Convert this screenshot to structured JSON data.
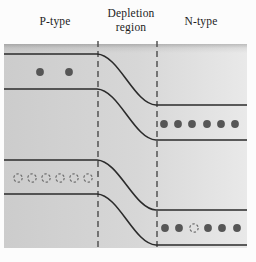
{
  "labels": {
    "p_type": "P-type",
    "depletion_line1": "Depletion",
    "depletion_line2": "region",
    "n_type": "N-type"
  },
  "colors": {
    "page_bg": "#fcfcfc",
    "box_fill_left": "#cccccc",
    "box_fill_right": "#e9e9e9",
    "band_line": "#2b2b2b",
    "boundary_dash": "#4a4a4a",
    "electron_fill": "#565656",
    "hole_stroke": "#6f6f6f",
    "label_text": "#1d1d1d"
  },
  "diagram": {
    "box": {
      "left": 4,
      "top": 44,
      "right": 247,
      "bottom": 248
    },
    "bend": {
      "start_x": 97,
      "end_x": 156
    },
    "bands": [
      {
        "name": "conduction-upper",
        "p_y": 54,
        "n_y": 105
      },
      {
        "name": "conduction-lower",
        "p_y": 89,
        "n_y": 140
      },
      {
        "name": "valence-upper",
        "p_y": 160,
        "n_y": 210
      },
      {
        "name": "valence-lower",
        "p_y": 194,
        "n_y": 245
      }
    ],
    "boundaries": [
      98,
      157
    ],
    "carriers": {
      "electron_radius": 3.9,
      "hole_radius": 4.2,
      "electrons": [
        [
          40,
          72
        ],
        [
          69,
          72
        ],
        [
          164,
          124
        ],
        [
          178,
          124
        ],
        [
          192,
          124
        ],
        [
          207,
          124
        ],
        [
          221,
          124
        ],
        [
          235,
          124
        ],
        [
          165,
          228
        ],
        [
          179,
          228
        ],
        [
          208,
          228
        ],
        [
          222,
          228
        ],
        [
          237,
          228
        ]
      ],
      "holes": [
        [
          18,
          178
        ],
        [
          32,
          178
        ],
        [
          46,
          178
        ],
        [
          60,
          178
        ],
        [
          74,
          178
        ],
        [
          88,
          178
        ],
        [
          194,
          228
        ]
      ]
    }
  }
}
